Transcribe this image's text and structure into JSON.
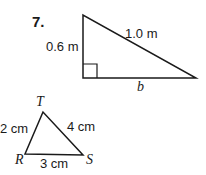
{
  "problem": {
    "number": "7.",
    "right_triangle": {
      "leg_label": "0.6 m",
      "hypotenuse_label": "1.0 m",
      "base_label": "b",
      "right_angle_marker": true
    },
    "triangle_RST": {
      "vertices": [
        "T",
        "R",
        "S"
      ],
      "side_TR": "2 cm",
      "side_TS": "4 cm",
      "side_RS": "3 cm"
    }
  }
}
